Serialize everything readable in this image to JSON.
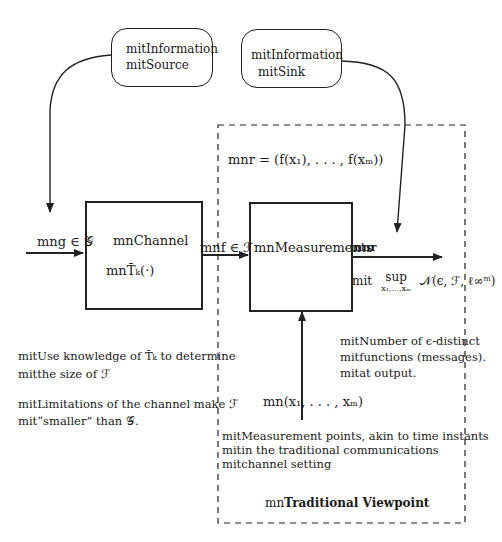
{
  "diagram": {
    "source_node": {
      "line1": "mitInformation",
      "line2": "mitSource"
    },
    "sink_node": {
      "line1": "mitInformation",
      "line2": "mitSink"
    },
    "channel_block": {
      "title": "mnChannel",
      "operator": "mnT̄ₖ(·)"
    },
    "measurements_block": {
      "title": "mnMeasurements"
    },
    "input_label": "mng ∈ 𝒢",
    "channel_output_label": "mnf ∈ ℱ",
    "measurement_output_label": "mnr",
    "r_definition": "mnr = (f(x₁), . . . , f(xₘ))",
    "sup_expression": {
      "prefix": "mit",
      "op": "sup",
      "subscript": "x₁,...,xₘ",
      "expr": "𝒩(ϵ, ℱ, ℓ∞ᵐ)"
    },
    "measurement_points_label": "mn(x₁, . . . , xₘ)",
    "annotations": {
      "epsilon_distinct": [
        "mitNumber of ϵ-distinct",
        "mitfunctions (messages).",
        "mitat output."
      ],
      "use_knowledge": [
        "mitUse knowledge of T̄ₖ to determine",
        "mitthe size of ℱ"
      ],
      "limitations": [
        "mitLimitations of the channel make ℱ",
        "mit“smaller” than 𝒢."
      ],
      "measurement_points": [
        "mitMeasurement points, akin to time instants",
        "mitin the traditional communications",
        "mitchannel setting"
      ]
    },
    "dashed_region_label_prefix": "mn",
    "dashed_region_label": "Traditional Viewpoint"
  }
}
